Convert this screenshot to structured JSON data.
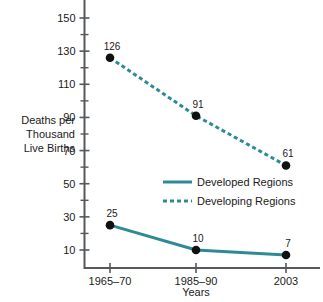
{
  "chart_data": {
    "type": "line",
    "title": "",
    "xlabel": "Years",
    "ylabel": "Deaths per Thousand Live Births",
    "ylabel_lines": [
      "Deaths per",
      "Thousand",
      "Live Births"
    ],
    "categories": [
      "1965–70",
      "1985–90",
      "2003"
    ],
    "ylim": [
      3,
      158
    ],
    "yticks": [
      10,
      30,
      50,
      70,
      90,
      110,
      130,
      150
    ],
    "ytick_labels": [
      "10",
      "30",
      "50",
      "70",
      "90",
      "110",
      "130",
      "150"
    ],
    "yminor_ticks": [
      20,
      40,
      60,
      80,
      100,
      120,
      140
    ],
    "grid": false,
    "legend_position": "center-right",
    "series": [
      {
        "name": "Developed Regions",
        "style": "solid",
        "color": "#2e8b96",
        "values": [
          25,
          10,
          7
        ],
        "point_labels": [
          "25",
          "10",
          "7"
        ]
      },
      {
        "name": "Developing Regions",
        "style": "dashed",
        "color": "#2e8b96",
        "values": [
          126,
          91,
          61
        ],
        "point_labels": [
          "126",
          "91",
          "61"
        ]
      }
    ],
    "marker_color": "#111111"
  },
  "legend": {
    "items": [
      {
        "label": "Developed Regions",
        "style": "solid"
      },
      {
        "label": "Developing Regions",
        "style": "dashed"
      }
    ]
  }
}
